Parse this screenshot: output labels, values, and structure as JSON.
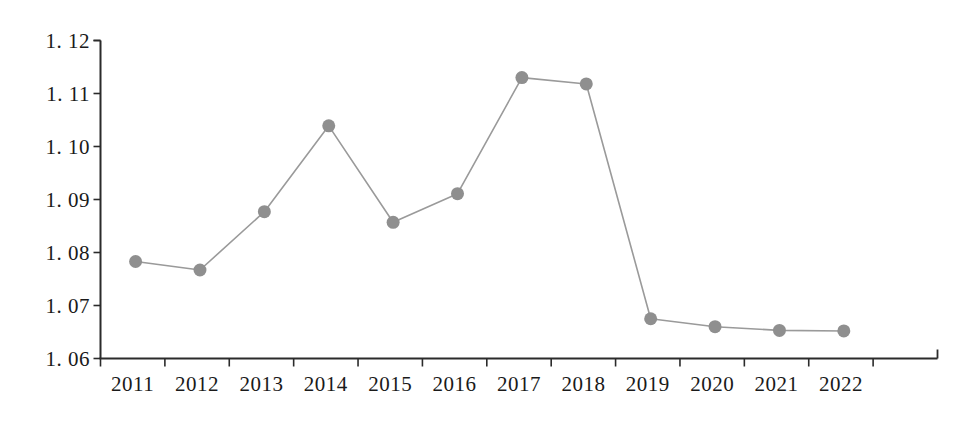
{
  "chart_data": {
    "type": "line",
    "title": "",
    "subtitle": "",
    "xlabel": "",
    "ylabel": "",
    "categories": [
      "2011",
      "2012",
      "2013",
      "2014",
      "2015",
      "2016",
      "2017",
      "2018",
      "2019",
      "2020",
      "2021",
      "2022"
    ],
    "values": [
      1.0783,
      1.0767,
      1.0877,
      1.1039,
      1.0857,
      1.0911,
      1.113,
      1.1118,
      1.0675,
      1.066,
      1.0653,
      1.0652
    ],
    "series": [
      {
        "name": "series-1",
        "values": [
          1.0783,
          1.0767,
          1.0877,
          1.1039,
          1.0857,
          1.0911,
          1.113,
          1.1118,
          1.0675,
          1.066,
          1.0653,
          1.0652
        ]
      }
    ],
    "ylim": [
      1.06,
      1.12
    ],
    "ytick_values": [
      1.06,
      1.07,
      1.08,
      1.09,
      1.1,
      1.11,
      1.12
    ],
    "ytick_labels": [
      "1. 06",
      "1. 07",
      "1. 08",
      "1. 09",
      "1. 10",
      "1. 11",
      "1. 12"
    ],
    "xtick_labels": [
      "2011",
      "2012",
      "2013",
      "2014",
      "2015",
      "2016",
      "2017",
      "2018",
      "2019",
      "2020",
      "2021",
      "2022"
    ],
    "grid": false,
    "legend": null,
    "legend_position": "none",
    "annotations": [],
    "colors": {
      "line": "#9a9a9a",
      "marker": "#8f8f8f",
      "axis": "#2b2b2b",
      "text": "#1a1a1a",
      "background": "#ffffff"
    },
    "marker_style": "circle",
    "marker_size": 13,
    "line_width": 1.6
  }
}
